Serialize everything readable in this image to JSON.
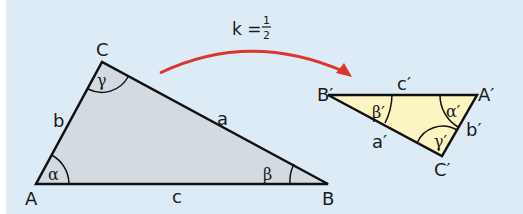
{
  "scale_factor": {
    "label": "k = ",
    "numerator": "1",
    "denominator": "2"
  },
  "colors": {
    "background": "#dcebf5",
    "original_fill": "#d3dbe2",
    "image_fill": "#fbf5c2",
    "arrow": "#d9372a",
    "stroke": "#111111"
  },
  "original_triangle": {
    "vertices": {
      "A": "A",
      "B": "B",
      "C": "C"
    },
    "sides": {
      "a": "a",
      "b": "b",
      "c": "c"
    },
    "angles": {
      "alpha": "α",
      "beta": "β",
      "gamma": "γ"
    }
  },
  "image_triangle": {
    "vertices": {
      "A": "A′",
      "B": "B′",
      "C": "C′"
    },
    "sides": {
      "a": "a′",
      "b": "b′",
      "c": "c′"
    },
    "angles": {
      "alpha": "α′",
      "beta": "β′",
      "gamma": "γ′"
    }
  }
}
